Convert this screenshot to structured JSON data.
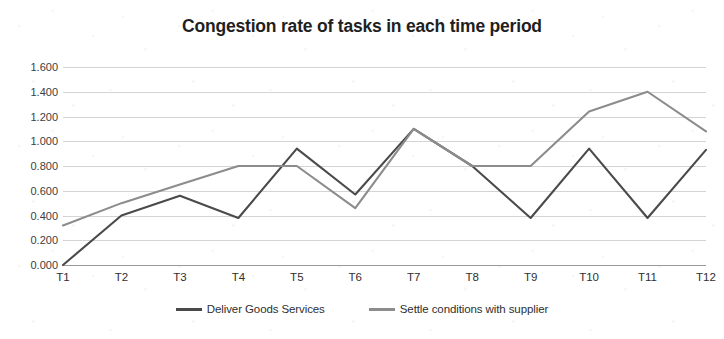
{
  "chart_data": {
    "type": "line",
    "title": "Congestion rate of tasks in each time period",
    "xlabel": "",
    "ylabel": "",
    "categories": [
      "T1",
      "T2",
      "T3",
      "T4",
      "T5",
      "T6",
      "T7",
      "T8",
      "T9",
      "T10",
      "T11",
      "T12"
    ],
    "ylim": [
      0.0,
      1.6
    ],
    "ytick_labels": [
      "0.000",
      "0.200",
      "0.400",
      "0.600",
      "0.800",
      "1.000",
      "1.200",
      "1.400",
      "1.600"
    ],
    "ytick_values": [
      0.0,
      0.2,
      0.4,
      0.6,
      0.8,
      1.0,
      1.2,
      1.4,
      1.6
    ],
    "grid": true,
    "legend_position": "bottom-center",
    "series": [
      {
        "name": "Deliver Goods Services",
        "color": "#4a4a4a",
        "values": [
          0.0,
          0.4,
          0.56,
          0.38,
          0.94,
          0.57,
          1.1,
          0.8,
          0.38,
          0.94,
          0.38,
          0.93
        ]
      },
      {
        "name": "Settle conditions with supplier",
        "color": "#8c8c8c",
        "values": [
          0.32,
          0.5,
          0.65,
          0.8,
          0.8,
          0.46,
          1.1,
          0.8,
          0.8,
          1.24,
          1.4,
          1.08
        ]
      }
    ]
  }
}
